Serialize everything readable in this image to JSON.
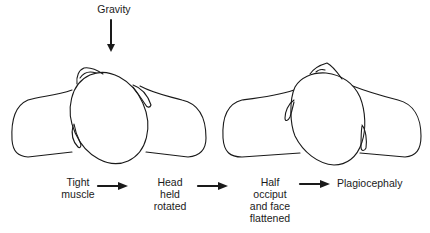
{
  "figure": {
    "force_label": "Gravity",
    "left_panel": "infant lying supine, head rotated toward one side",
    "right_panel": "infant lying supine, head with flattened occiput"
  },
  "flow": {
    "steps": [
      {
        "label": "Tight\nmuscle"
      },
      {
        "label": "Head\nheld\nrotated"
      },
      {
        "label": "Half\nocciput\nand face\nflattened"
      },
      {
        "label": "Plagiocephaly"
      }
    ],
    "arrow_count": 3
  },
  "colors": {
    "line": "#1a1a1a",
    "background": "#ffffff"
  }
}
